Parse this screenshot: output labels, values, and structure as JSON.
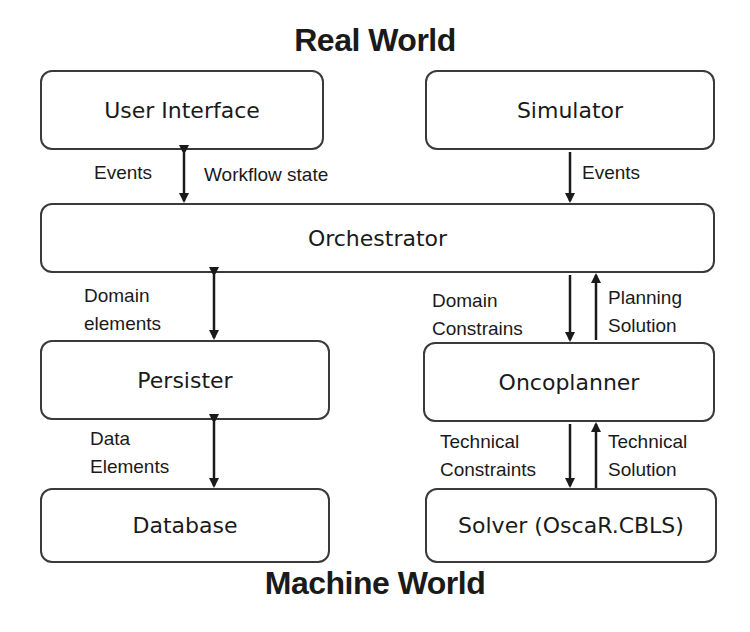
{
  "titles": {
    "top": "Real World",
    "bottom": "Machine World"
  },
  "boxes": {
    "user_interface": "User Interface",
    "simulator": "Simulator",
    "orchestrator": "Orchestrator",
    "persister": "Persister",
    "oncoplanner": "Oncoplanner",
    "database": "Database",
    "solver": "Solver (OscaR.CBLS)"
  },
  "labels": {
    "ui_events": "Events",
    "ui_workflow_state": "Workflow state",
    "sim_events": "Events",
    "domain_elements_1": "Domain",
    "domain_elements_2": "elements",
    "domain_constrains_1": "Domain",
    "domain_constrains_2": "Constrains",
    "planning_solution_1": "Planning",
    "planning_solution_2": "Solution",
    "data_elements_1": "Data",
    "data_elements_2": "Elements",
    "technical_constraints_1": "Technical",
    "technical_constraints_2": "Constraints",
    "technical_solution_1": "Technical",
    "technical_solution_2": "Solution"
  },
  "colors": {
    "stroke": "#3a3a3a",
    "text": "#1a1a1a",
    "background": "#ffffff"
  }
}
